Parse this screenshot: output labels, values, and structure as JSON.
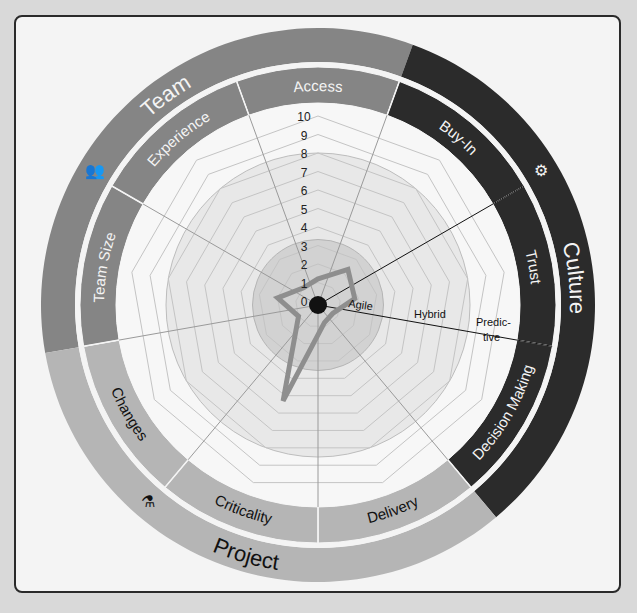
{
  "colors": {
    "background": "#d9d9d9",
    "card": "#f4f4f4",
    "team": "#858585",
    "culture": "#2b2b2b",
    "project": "#b5b5b5",
    "inner_disc": "#e8e8e8",
    "core_disc": "#d2d2d2",
    "polygon": "#8e8e8e",
    "grid": "#c4c4c4"
  },
  "categories": [
    {
      "name": "Team",
      "icon": "people-icon"
    },
    {
      "name": "Culture",
      "icon": "head-gears-icon"
    },
    {
      "name": "Project",
      "icon": "flask-icon"
    }
  ],
  "zones": {
    "agile": "Agile",
    "hybrid": "Hybrid",
    "predictive_1": "Predic-",
    "predictive_2": "tive"
  },
  "chart_data": {
    "type": "radar",
    "title": "",
    "axes": [
      "Access",
      "Buy-In",
      "Trust",
      "Decision Making",
      "Delivery",
      "Criticality",
      "Changes",
      "Team Size",
      "Experience"
    ],
    "axis_groups": {
      "Team": [
        "Experience",
        "Team Size",
        "Access"
      ],
      "Culture": [
        "Buy-In",
        "Trust",
        "Decision Making"
      ],
      "Project": [
        "Delivery",
        "Criticality",
        "Changes"
      ]
    },
    "values": [
      1.2,
      2.3,
      1.8,
      0.7,
      0.8,
      5.3,
      1.0,
      2.0,
      1.0
    ],
    "range": [
      0,
      10
    ],
    "ticks": [
      "0",
      "1",
      "2",
      "3",
      "4",
      "5",
      "6",
      "7",
      "8",
      "9",
      "10"
    ],
    "zones": [
      {
        "label": "Agile",
        "range": [
          0,
          3
        ]
      },
      {
        "label": "Hybrid",
        "range": [
          3,
          8
        ]
      },
      {
        "label": "Predictive",
        "range": [
          8,
          10
        ]
      }
    ],
    "grid": true
  }
}
